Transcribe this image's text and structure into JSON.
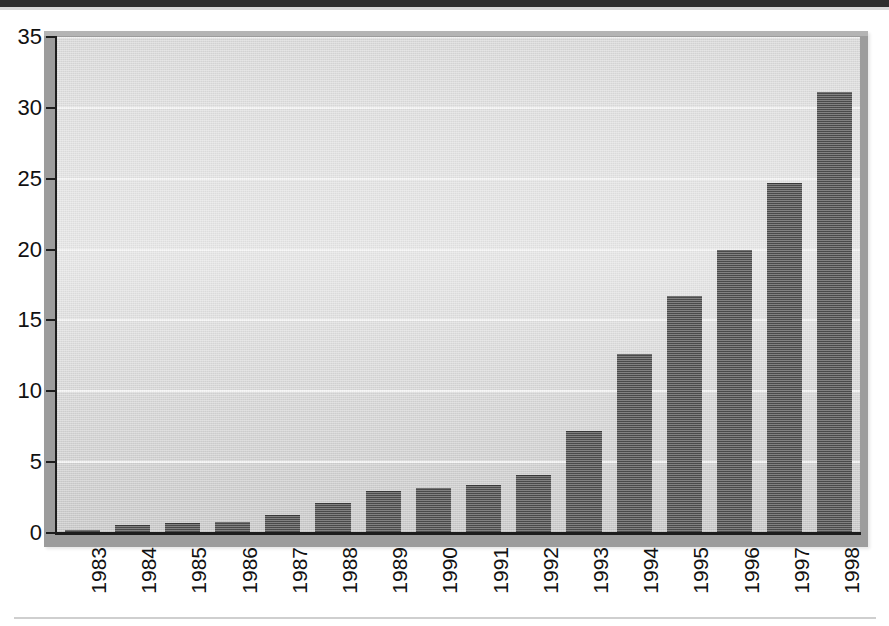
{
  "chart_data": {
    "type": "bar",
    "title": "",
    "subtitle": "",
    "xlabel": "",
    "ylabel": "",
    "categories": [
      "1983",
      "1984",
      "1985",
      "1986",
      "1987",
      "1988",
      "1989",
      "1990",
      "1991",
      "1992",
      "1993",
      "1994",
      "1995",
      "1996",
      "1997",
      "1998"
    ],
    "values": [
      0.2,
      0.6,
      0.7,
      0.8,
      1.3,
      2.1,
      3.0,
      3.2,
      3.4,
      4.1,
      7.2,
      12.6,
      16.7,
      20.0,
      24.7,
      31.1
    ],
    "series": [
      {
        "name": "",
        "values": [
          0.2,
          0.6,
          0.7,
          0.8,
          1.3,
          2.1,
          3.0,
          3.2,
          3.4,
          4.1,
          7.2,
          12.6,
          16.7,
          20.0,
          24.7,
          31.1
        ]
      }
    ],
    "ylim": [
      0,
      35
    ],
    "yticks": [
      0,
      5,
      10,
      15,
      20,
      25,
      30,
      35
    ],
    "ytick_labels": [
      "0",
      "5",
      "10",
      "15",
      "20",
      "25",
      "30",
      "35"
    ],
    "xtick_labels": [
      "1983",
      "1984",
      "1985",
      "1986",
      "1987",
      "1988",
      "1989",
      "1990",
      "1991",
      "1992",
      "1993",
      "1994",
      "1995",
      "1996",
      "1997",
      "1998"
    ],
    "xtick_rotation": 90,
    "grid": true,
    "grid_axis": "y",
    "legend": false,
    "legend_position": "none",
    "annotations": [],
    "colors": {
      "bar": "#4c4c4c",
      "plot_background": "#e0e0e0",
      "frame": "#9c9c9c",
      "gridline": "#f4f4f4",
      "axis": "#1d1d1d",
      "tick_label": "#111111",
      "page_background": "#ffffff"
    }
  }
}
